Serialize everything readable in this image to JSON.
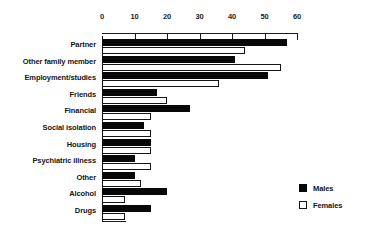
{
  "chart_data": {
    "type": "bar",
    "orientation": "horizontal",
    "title": "",
    "subtitle": "",
    "xlabel": "",
    "ylabel": "",
    "xlim": [
      0,
      60
    ],
    "xticks": [
      0,
      10,
      20,
      30,
      40,
      50,
      60
    ],
    "xtick_labels": [
      "0",
      "10",
      "20",
      "30",
      "40",
      "50",
      "60"
    ],
    "grid": false,
    "legend_position": "right-bottom",
    "categories": [
      "Partner",
      "Other family member",
      "Employment/studies",
      "Friends",
      "Financial",
      "Social isolation",
      "Housing",
      "Psychiatric illness",
      "Other",
      "Alcohol",
      "Drugs"
    ],
    "series": [
      {
        "name": "Males",
        "color": "#080808",
        "values": [
          57,
          41,
          51,
          17,
          27,
          13,
          15,
          10,
          10,
          20,
          15
        ]
      },
      {
        "name": "Females",
        "color": "#ffffff",
        "values": [
          44,
          55,
          36,
          20,
          15,
          15,
          15,
          15,
          12,
          7,
          7
        ]
      }
    ]
  },
  "legend": {
    "items": [
      {
        "label": "Males",
        "swatch": "filled-black-square"
      },
      {
        "label": "Females",
        "swatch": "outlined-white-square"
      }
    ]
  }
}
